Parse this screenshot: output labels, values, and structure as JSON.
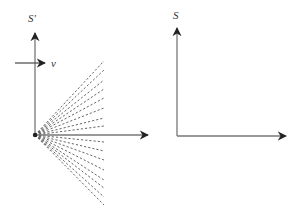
{
  "left_frame": {
    "axis_label": "S'",
    "velocity_label": "v",
    "origin": [
      35,
      135
    ],
    "y_axis_tip": [
      35,
      33
    ],
    "x_axis_tip": [
      148,
      135
    ],
    "velocity_arrow": {
      "from": [
        15,
        63
      ],
      "to": [
        45,
        63
      ],
      "label_pos": [
        51,
        67
      ]
    },
    "axis_label_pos": [
      28,
      22
    ],
    "ray_end_x": 104,
    "ray_end_ys": [
      61,
      70,
      80,
      89,
      98,
      108,
      118,
      126,
      142,
      151,
      160,
      170,
      180,
      188,
      197,
      205
    ]
  },
  "right_frame": {
    "axis_label": "S",
    "origin": [
      177,
      136
    ],
    "y_axis_tip": [
      177,
      28
    ],
    "x_axis_tip": [
      286,
      136
    ],
    "axis_label_pos": [
      173,
      19
    ]
  },
  "colors": {
    "axis": "#777777",
    "arrowhead": "#222222",
    "rays": "#555555"
  }
}
